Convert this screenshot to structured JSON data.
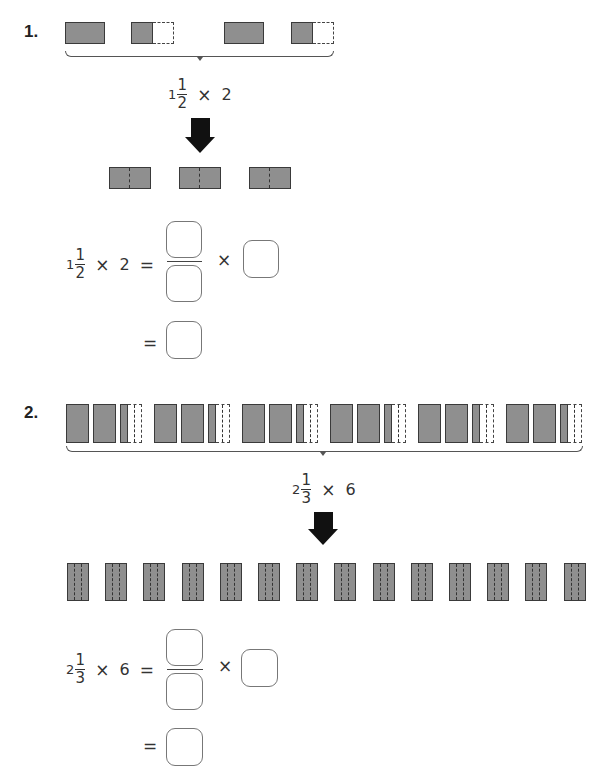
{
  "problems": [
    {
      "number": "1.",
      "expression": {
        "whole": "1",
        "numerator": "1",
        "denominator": "2",
        "times": "×",
        "multiplier": "2"
      },
      "equation": {
        "whole": "1",
        "numerator": "1",
        "denominator": "2",
        "times": "×",
        "multiplier": "2",
        "equals": "=",
        "times2": "×",
        "equals2": "=",
        "answer_boxes": {
          "numerator": "",
          "denominator": "",
          "factor": "",
          "result": ""
        }
      },
      "model_groups": 2,
      "result_blocks": 3
    },
    {
      "number": "2.",
      "expression": {
        "whole": "2",
        "numerator": "1",
        "denominator": "3",
        "times": "×",
        "multiplier": "6"
      },
      "equation": {
        "whole": "2",
        "numerator": "1",
        "denominator": "3",
        "times": "×",
        "multiplier": "6",
        "equals": "=",
        "times2": "×",
        "equals2": "=",
        "answer_boxes": {
          "numerator": "",
          "denominator": "",
          "factor": "",
          "result": ""
        }
      },
      "model_groups": 6,
      "result_blocks": 14
    }
  ],
  "colors": {
    "block_fill": "#8f8f8f",
    "block_border": "#3a3a3a",
    "arrow": "#111111"
  }
}
